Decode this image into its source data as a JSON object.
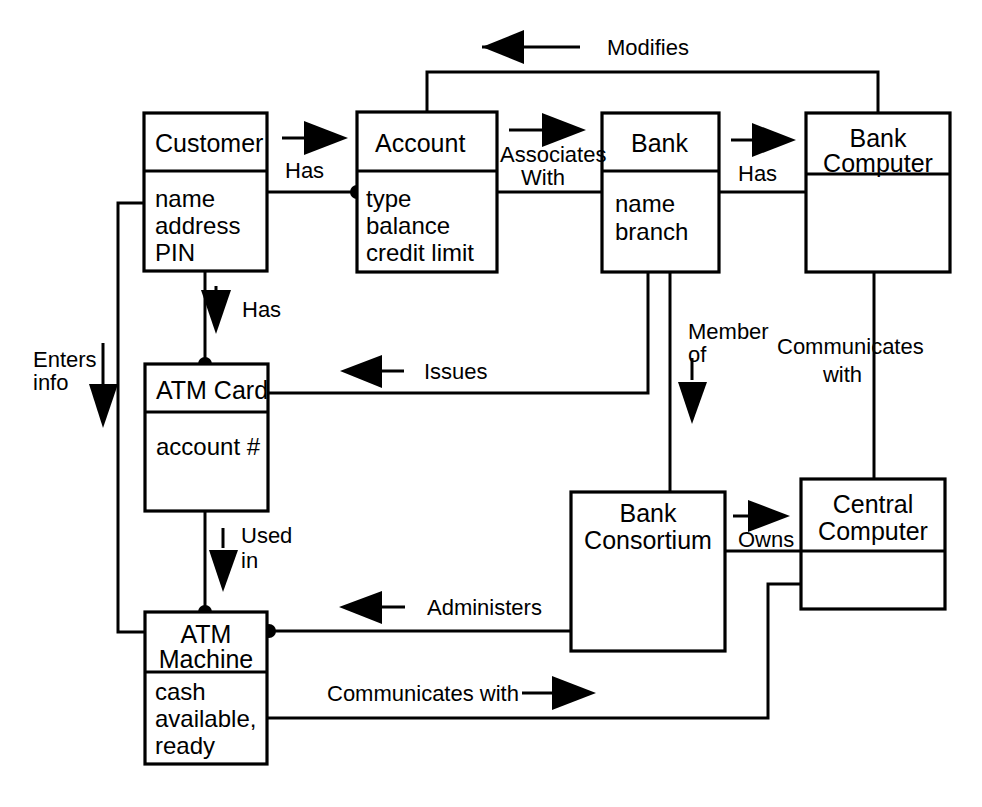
{
  "diagram": {
    "type": "entity-relationship",
    "stroke_color": "#000000",
    "background_color": "#ffffff",
    "entities": [
      {
        "id": "customer",
        "name": "Customer",
        "attributes": [
          "name",
          "address",
          "PIN"
        ],
        "box": {
          "x": 144,
          "y": 113,
          "w": 123,
          "h": 158,
          "divider_y": 171
        }
      },
      {
        "id": "account",
        "name": "Account",
        "attributes": [
          "type",
          "balance",
          "credit limit"
        ],
        "box": {
          "x": 357,
          "y": 112,
          "w": 140,
          "h": 160,
          "divider_y": 171
        }
      },
      {
        "id": "bank",
        "name": "Bank",
        "attributes": [
          "name",
          "branch"
        ],
        "box": {
          "x": 602,
          "y": 113,
          "w": 117,
          "h": 159,
          "divider_y": 171
        }
      },
      {
        "id": "bank-computer",
        "name": "Bank Computer",
        "attributes": [],
        "box": {
          "x": 806,
          "y": 113,
          "w": 144,
          "h": 159,
          "divider_y": 174
        }
      },
      {
        "id": "atm-card",
        "name": "ATM Card",
        "attributes": [
          "account #"
        ],
        "box": {
          "x": 145,
          "y": 364,
          "w": 123,
          "h": 147,
          "divider_y": 412
        }
      },
      {
        "id": "bank-consortium",
        "name": "Bank Consortium",
        "attributes": [],
        "box": {
          "x": 571,
          "y": 492,
          "w": 154,
          "h": 159,
          "divider_y": null
        }
      },
      {
        "id": "central-computer",
        "name": "Central Computer",
        "attributes": [],
        "box": {
          "x": 801,
          "y": 479,
          "w": 144,
          "h": 130,
          "divider_y": 551
        }
      },
      {
        "id": "atm-machine",
        "name": "ATM Machine",
        "attributes": [
          "cash",
          "available,",
          "ready"
        ],
        "box": {
          "x": 145,
          "y": 612,
          "w": 122,
          "h": 152,
          "divider_y": 672
        }
      }
    ],
    "relationships": [
      {
        "id": "has-account",
        "label": "Has",
        "from": "customer",
        "to": "account",
        "direction": "right"
      },
      {
        "id": "associates-with",
        "label_line1": "Associates",
        "label_line2": "With",
        "from": "account",
        "to": "bank",
        "direction": "right"
      },
      {
        "id": "has-bank-computer",
        "label": "Has",
        "from": "bank",
        "to": "bank-computer",
        "direction": "right"
      },
      {
        "id": "modifies",
        "label": "Modifies",
        "from": "bank-computer",
        "to": "account",
        "direction": "left"
      },
      {
        "id": "has-atm-card",
        "label": "Has",
        "from": "customer",
        "to": "atm-card",
        "direction": "down"
      },
      {
        "id": "issues",
        "label": "Issues",
        "from": "bank",
        "to": "atm-card",
        "direction": "left"
      },
      {
        "id": "member-of",
        "label_line1": "Member",
        "label_line2": "of",
        "from": "bank",
        "to": "bank-consortium",
        "direction": "down"
      },
      {
        "id": "communicates-with-upper",
        "label_line1": "Communicates",
        "label_line2": "with",
        "from": "bank-computer",
        "to": "central-computer",
        "direction": "down"
      },
      {
        "id": "owns",
        "label": "Owns",
        "from": "bank-consortium",
        "to": "central-computer",
        "direction": "right"
      },
      {
        "id": "administers",
        "label": "Administers",
        "from": "bank-consortium",
        "to": "atm-machine",
        "direction": "left"
      },
      {
        "id": "used-in",
        "label_line1": "Used",
        "label_line2": "in",
        "from": "atm-card",
        "to": "atm-machine",
        "direction": "down"
      },
      {
        "id": "enters-info",
        "label_line1": "Enters",
        "label_line2": "info",
        "from": "customer",
        "to": "atm-machine",
        "direction": "down"
      },
      {
        "id": "communicates-with-lower",
        "label": "Communicates with",
        "from": "atm-machine",
        "to": "central-computer",
        "direction": "right"
      }
    ],
    "labels": {
      "modifies": "Modifies",
      "has_1": "Has",
      "associates_l1": "Associates",
      "associates_l2": "With",
      "has_2": "Has",
      "has_3": "Has",
      "enters_l1": "Enters",
      "enters_l2": "info",
      "issues": "Issues",
      "member_l1": "Member",
      "member_l2": "of",
      "comm_upper_l1": "Communicates",
      "comm_upper_l2": "with",
      "used_l1": "Used",
      "used_l2": "in",
      "owns": "Owns",
      "administers": "Administers",
      "comm_lower": "Communicates with"
    },
    "entity_text": {
      "customer_title": "Customer",
      "customer_a1": "name",
      "customer_a2": "address",
      "customer_a3": "PIN",
      "account_title": "Account",
      "account_a1": "type",
      "account_a2": "balance",
      "account_a3": "credit limit",
      "bank_title": "Bank",
      "bank_a1": "name",
      "bank_a2": "branch",
      "bankcomp_title_l1": "Bank",
      "bankcomp_title_l2": "Computer",
      "atmcard_title": "ATM Card",
      "atmcard_a1": "account #",
      "consortium_title_l1": "Bank",
      "consortium_title_l2": "Consortium",
      "central_title_l1": "Central",
      "central_title_l2": "Computer",
      "atmmachine_title_l1": "ATM",
      "atmmachine_title_l2": "Machine",
      "atmmachine_a1": "cash",
      "atmmachine_a2": "available,",
      "atmmachine_a3": "ready"
    }
  }
}
